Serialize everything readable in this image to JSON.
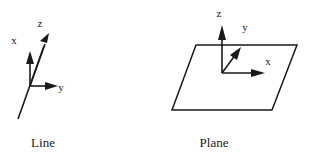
{
  "figure": {
    "background_color": "#ffffff",
    "ink_color": "#1a1a1a",
    "width": 312,
    "height": 157
  },
  "panels": [
    {
      "id": "line-panel",
      "caption": "Line",
      "caption_position": {
        "x": 43,
        "y": 147
      },
      "axes": [
        {
          "name": "x",
          "label": "x",
          "label_position": {
            "x": 14,
            "y": 44
          },
          "origin": {
            "x": 30,
            "y": 86
          },
          "tip": {
            "x": 30,
            "y": 52
          }
        },
        {
          "name": "z",
          "label": "z",
          "label_position": {
            "x": 40,
            "y": 27
          },
          "origin": {
            "x": 30,
            "y": 86
          },
          "tip": {
            "x": 49,
            "y": 33
          }
        },
        {
          "name": "y",
          "label": "y",
          "label_position": {
            "x": 61,
            "y": 91
          },
          "origin": {
            "x": 30,
            "y": 86
          },
          "tip": {
            "x": 58,
            "y": 86
          }
        }
      ],
      "line_segment": {
        "from": {
          "x": 18,
          "y": 119
        },
        "to": {
          "x": 49,
          "y": 33
        }
      }
    },
    {
      "id": "plane-panel",
      "caption": "Plane",
      "caption_position": {
        "x": 214,
        "y": 147
      },
      "axes": [
        {
          "name": "z",
          "label": "z",
          "label_position": {
            "x": 219,
            "y": 17
          },
          "origin": {
            "x": 222,
            "y": 73
          },
          "tip": {
            "x": 222,
            "y": 26
          }
        },
        {
          "name": "y",
          "label": "y",
          "label_position": {
            "x": 245,
            "y": 31
          },
          "origin": {
            "x": 222,
            "y": 73
          },
          "tip": {
            "x": 240,
            "y": 48
          }
        },
        {
          "name": "x",
          "label": "x",
          "label_position": {
            "x": 268,
            "y": 65
          },
          "origin": {
            "x": 222,
            "y": 73
          },
          "tip": {
            "x": 265,
            "y": 73
          }
        }
      ],
      "parallelogram": {
        "points": [
          {
            "x": 196,
            "y": 45
          },
          {
            "x": 297,
            "y": 45
          },
          {
            "x": 272,
            "y": 110
          },
          {
            "x": 172,
            "y": 110
          }
        ]
      }
    }
  ]
}
